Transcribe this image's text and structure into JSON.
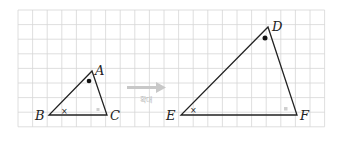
{
  "diagram": {
    "grid": {
      "x0": 18,
      "y0": 10,
      "cell": 14.6,
      "cols": 21,
      "rows": 8,
      "color": "#d4d4d4"
    },
    "triangle_small": {
      "vertices": {
        "A": [
          92,
          71
        ],
        "B": [
          49,
          115
        ],
        "C": [
          107,
          115
        ]
      },
      "labels": {
        "A": "A",
        "B": "B",
        "C": "C"
      }
    },
    "triangle_large": {
      "vertices": {
        "D": [
          268,
          27
        ],
        "E": [
          181,
          115
        ],
        "F": [
          297,
          115
        ]
      },
      "labels": {
        "D": "D",
        "E": "E",
        "F": "F"
      }
    },
    "arrow": {
      "label": "확대",
      "color": "#c8c8c8"
    },
    "angle_marks": {
      "top": "dot",
      "left": "cross",
      "right": "square"
    }
  }
}
